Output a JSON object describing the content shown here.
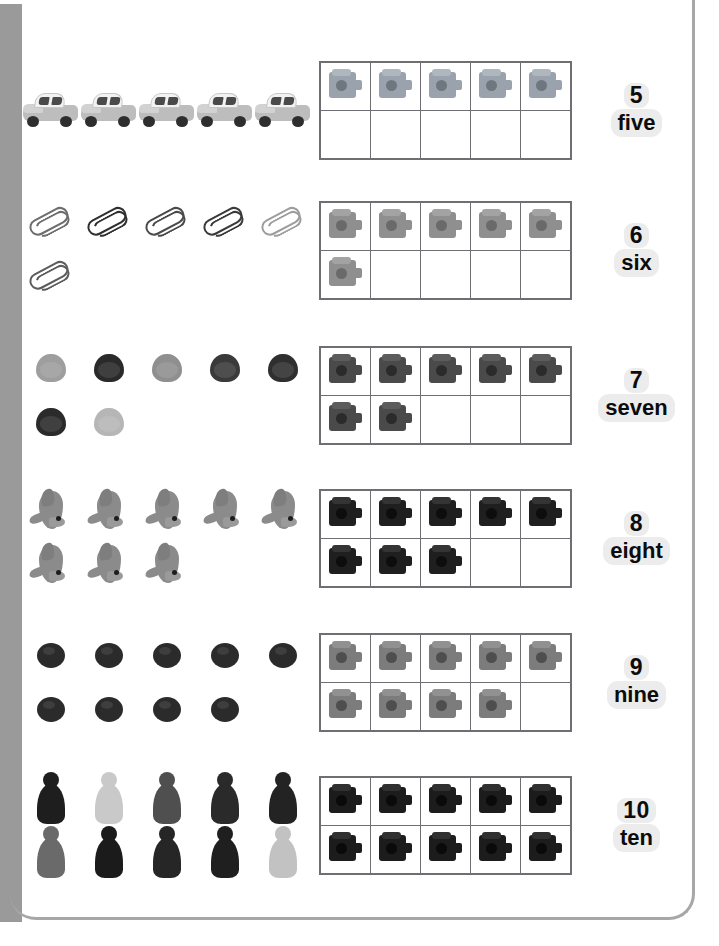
{
  "page": {
    "spine_color": "#9a9a9a",
    "frame_color": "#a7a7a7",
    "background": "#ffffff",
    "grid_line_color": "#6e6e73",
    "label_highlight_color": "#ececec",
    "text_color": "#0c0c0c"
  },
  "columns": {
    "objects_heading": "Real objects",
    "tenframe_heading": "Ten frame",
    "label_heading": "Number name"
  },
  "tenframe": {
    "columns": 5,
    "rows": 2,
    "capacity": 10
  },
  "rows": [
    {
      "id": "row-five",
      "numeral": "5",
      "word": "five",
      "count": 5,
      "object_name": "toy-car",
      "object_label": "toy cars",
      "object_top_row": 5,
      "object_bottom_row": 0,
      "object_colors": [
        "#bdbdbd",
        "#bdbdbd",
        "#bdbdbd",
        "#bdbdbd",
        "#bdbdbd"
      ],
      "cube_color": "#9aa3ad",
      "cube_top_color": "#aeb6be",
      "cube_stud_color": "#6f767e",
      "cube_filled_top": 5,
      "cube_filled_bottom": 0
    },
    {
      "id": "row-six",
      "numeral": "6",
      "word": "six",
      "count": 6,
      "object_name": "paper-clip",
      "object_label": "paper clips",
      "object_top_row": 5,
      "object_bottom_row": 1,
      "object_colors": [
        "#6d6d6d",
        "#2f2f2f",
        "#4a4a4a",
        "#3a3a3a",
        "#9d9d9d",
        "#5c5c5c"
      ],
      "cube_color": "#8f8f8f",
      "cube_top_color": "#a3a3a3",
      "cube_stud_color": "#6a6a6a",
      "cube_filled_top": 5,
      "cube_filled_bottom": 1
    },
    {
      "id": "row-seven",
      "numeral": "7",
      "word": "seven",
      "count": 7,
      "object_name": "shell",
      "object_label": "shells",
      "object_top_row": 5,
      "object_bottom_row": 2,
      "object_colors": [
        "#9e9e9e",
        "#2a2a2a",
        "#8f8f8f",
        "#3a3a3a",
        "#2f2f2f",
        "#2b2b2b",
        "#b6b6b6"
      ],
      "cube_color": "#4a4a4a",
      "cube_top_color": "#5c5c5c",
      "cube_stud_color": "#2b2b2b",
      "cube_filled_top": 5,
      "cube_filled_bottom": 2
    },
    {
      "id": "row-eight",
      "numeral": "8",
      "word": "eight",
      "count": 8,
      "object_name": "dolphin",
      "object_label": "toy dolphins",
      "object_top_row": 5,
      "object_bottom_row": 3,
      "object_colors": [
        "#8b8b8b",
        "#8b8b8b",
        "#8b8b8b",
        "#8b8b8b",
        "#8b8b8b",
        "#8b8b8b",
        "#8b8b8b",
        "#8b8b8b"
      ],
      "cube_color": "#1f1f1f",
      "cube_top_color": "#343434",
      "cube_stud_color": "#0d0d0d",
      "cube_filled_top": 5,
      "cube_filled_bottom": 3
    },
    {
      "id": "row-nine",
      "numeral": "9",
      "word": "nine",
      "count": 9,
      "object_name": "bead",
      "object_label": "beads",
      "object_top_row": 5,
      "object_bottom_row": 4,
      "object_colors": [
        "#2b2b2b",
        "#2b2b2b",
        "#2b2b2b",
        "#2b2b2b",
        "#2b2b2b",
        "#2b2b2b",
        "#2b2b2b",
        "#2b2b2b",
        "#2b2b2b"
      ],
      "cube_color": "#7c7c7c",
      "cube_top_color": "#919191",
      "cube_stud_color": "#4e4e4e",
      "cube_filled_top": 5,
      "cube_filled_bottom": 4
    },
    {
      "id": "row-ten",
      "numeral": "10",
      "word": "ten",
      "count": 10,
      "object_name": "game-pawn",
      "object_label": "game pawns",
      "object_top_row": 5,
      "object_bottom_row": 5,
      "object_colors": [
        "#1e1e1e",
        "#c9c9c9",
        "#4f4f4f",
        "#2a2a2a",
        "#232323",
        "#6a6a6a",
        "#1b1b1b",
        "#262626",
        "#1f1f1f",
        "#c2c2c2"
      ],
      "cube_color": "#1c1c1c",
      "cube_top_color": "#303030",
      "cube_stud_color": "#0a0a0a",
      "cube_filled_top": 5,
      "cube_filled_bottom": 5
    }
  ]
}
